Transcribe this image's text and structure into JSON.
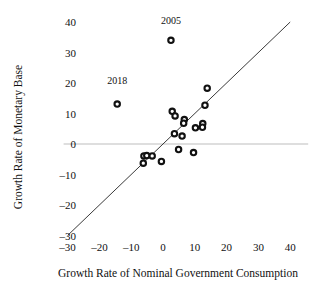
{
  "chart_data": {
    "type": "scatter",
    "title": "",
    "xlabel": "Growth Rate of Nominal Government Consumption",
    "ylabel": "Growth Rate of Monetary Base",
    "xlim": [
      -30,
      40
    ],
    "ylim": [
      -30,
      40
    ],
    "xticks": [
      -30,
      -20,
      -10,
      0,
      10,
      20,
      30,
      40
    ],
    "yticks": [
      -30,
      -20,
      -10,
      0,
      10,
      20,
      30,
      40
    ],
    "xtick_labels": [
      "–30",
      "–20",
      "–10",
      "0",
      "10",
      "20",
      "30",
      "40"
    ],
    "ytick_labels": [
      "–30",
      "–20",
      "–10",
      "0",
      "10",
      "20",
      "30",
      "40"
    ],
    "grid": false,
    "legend": "none",
    "zero_line_y": 0,
    "reference_line": {
      "name": "45-degree line",
      "from": [
        -30,
        -30
      ],
      "to": [
        40,
        40
      ]
    },
    "marker_style": "open-circle",
    "marker_color": "#111111",
    "points": [
      {
        "x": -14.4,
        "y": 13.1,
        "label": "2018"
      },
      {
        "x": 2.5,
        "y": 34.0,
        "label": "2005"
      },
      {
        "x": 13.9,
        "y": 18.3,
        "label": ""
      },
      {
        "x": 13.2,
        "y": 12.7,
        "label": ""
      },
      {
        "x": 2.9,
        "y": 10.7,
        "label": ""
      },
      {
        "x": 3.8,
        "y": 9.2,
        "label": ""
      },
      {
        "x": 6.7,
        "y": 8.0,
        "label": ""
      },
      {
        "x": 6.5,
        "y": 6.8,
        "label": ""
      },
      {
        "x": 12.5,
        "y": 6.7,
        "label": ""
      },
      {
        "x": 12.4,
        "y": 5.5,
        "label": ""
      },
      {
        "x": 10.2,
        "y": 5.3,
        "label": ""
      },
      {
        "x": 3.6,
        "y": 3.4,
        "label": ""
      },
      {
        "x": 6.0,
        "y": 2.6,
        "label": ""
      },
      {
        "x": 4.9,
        "y": -1.8,
        "label": ""
      },
      {
        "x": 9.6,
        "y": -2.8,
        "label": ""
      },
      {
        "x": -6.0,
        "y": -3.9,
        "label": ""
      },
      {
        "x": -5.1,
        "y": -3.8,
        "label": ""
      },
      {
        "x": -3.4,
        "y": -3.9,
        "label": ""
      },
      {
        "x": -6.2,
        "y": -6.3,
        "label": ""
      },
      {
        "x": -0.5,
        "y": -5.7,
        "label": ""
      }
    ],
    "annotations": [
      {
        "text": "2005",
        "x": 2.5,
        "y": 39.2
      },
      {
        "text": "2018",
        "x": -14.4,
        "y": 19.8
      }
    ]
  }
}
